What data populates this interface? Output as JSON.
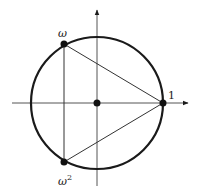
{
  "diagram": {
    "colors": {
      "stroke": "#1a1a1a",
      "background": "#ffffff"
    },
    "center": {
      "x": 97,
      "y": 103
    },
    "radius": 66,
    "axes": {
      "horizontal": {
        "x1": 12,
        "x2": 188,
        "arrow": "right"
      },
      "vertical": {
        "y1": 10,
        "y2": 186,
        "arrow": "up"
      }
    },
    "points": [
      {
        "id": "one",
        "label": "1",
        "x": 163,
        "y": 103
      },
      {
        "id": "omega",
        "label": "ω",
        "x": 64,
        "y": 44
      },
      {
        "id": "omega-squared",
        "label": "ω",
        "superscript": "2",
        "x": 64,
        "y": 162
      },
      {
        "id": "origin",
        "label": "",
        "x": 97,
        "y": 103
      }
    ],
    "triangle": [
      "omega",
      "one",
      "omega-squared"
    ]
  }
}
